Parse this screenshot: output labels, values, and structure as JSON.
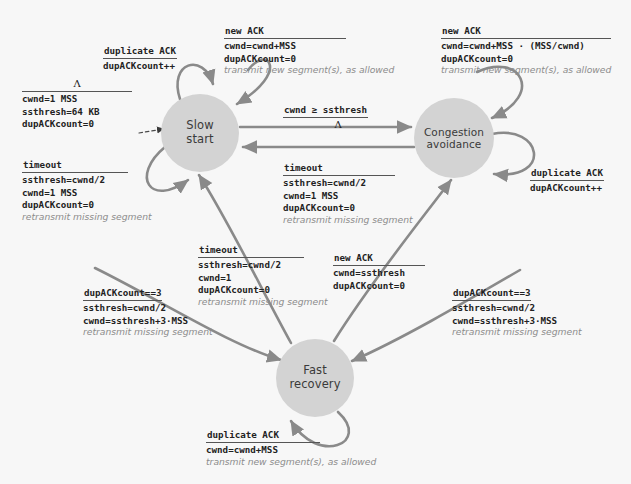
{
  "diagram": {
    "background_color": "#f7f7f7",
    "node_fill": "#d3d3d3",
    "arrow_color": "#808080",
    "note_color": "#8c8c8c"
  },
  "states": [
    {
      "id": "slow-start",
      "line1": "Slow",
      "line2": "start"
    },
    {
      "id": "congestion-avoidance",
      "line1": "Congestion",
      "line2": "avoidance"
    },
    {
      "id": "fast-recovery",
      "line1": "Fast",
      "line2": "recovery"
    }
  ],
  "transitions": {
    "init_to_slow_start": {
      "event": "Λ",
      "actions": [
        "cwnd=1 MSS",
        "ssthresh=64 KB",
        "dupACKcount=0"
      ],
      "note": ""
    },
    "slow_start_dupack_loop": {
      "event": "duplicate ACK",
      "actions": [
        "dupACKcount++"
      ],
      "note": ""
    },
    "slow_start_newack_loop": {
      "event": "new ACK",
      "actions": [
        "cwnd=cwnd+MSS",
        "dupACKcount=0"
      ],
      "note": "transmit new segment(s), as allowed"
    },
    "slow_start_timeout_loop": {
      "event": "timeout",
      "actions": [
        "ssthresh=cwnd/2",
        "cwnd=1 MSS",
        "dupACKcount=0"
      ],
      "note": "retransmit missing segment"
    },
    "slow_start_to_congestion_avoidance": {
      "event": "cwnd ≥ ssthresh",
      "actions": [
        "Λ"
      ],
      "note": ""
    },
    "congestion_avoidance_to_slow_start": {
      "event": "timeout",
      "actions": [
        "ssthresh=cwnd/2",
        "cwnd=1 MSS",
        "dupACKcount=0"
      ],
      "note": "retransmit missing segment"
    },
    "congestion_avoidance_newack_loop": {
      "event": "new ACK",
      "actions": [
        "cwnd=cwnd+MSS · (MSS/cwnd)",
        "dupACKcount=0"
      ],
      "note": "transmit new segment(s), as allowed"
    },
    "congestion_avoidance_dupack_loop": {
      "event": "duplicate ACK",
      "actions": [
        "dupACKcount++"
      ],
      "note": ""
    },
    "slow_start_to_fast_recovery": {
      "event": "dupACKcount==3",
      "actions": [
        "ssthresh=cwnd/2",
        "cwnd=ssthresh+3·MSS"
      ],
      "note": "retransmit missing segment"
    },
    "congestion_avoidance_to_fast_recovery": {
      "event": "dupACKcount==3",
      "actions": [
        "ssthresh=cwnd/2",
        "cwnd=ssthresh+3·MSS"
      ],
      "note": "retransmit missing segment"
    },
    "fast_recovery_to_slow_start": {
      "event": "timeout",
      "actions": [
        "ssthresh=cwnd/2",
        "cwnd=1",
        "dupACKcount=0"
      ],
      "note": "retransmit missing segment"
    },
    "fast_recovery_to_congestion_avoidance": {
      "event": "new ACK",
      "actions": [
        "cwnd=ssthresh",
        "dupACKcount=0"
      ],
      "note": ""
    },
    "fast_recovery_dupack_loop": {
      "event": "duplicate ACK",
      "actions": [
        "cwnd=cwnd+MSS"
      ],
      "note": "transmit new segment(s), as allowed"
    }
  }
}
